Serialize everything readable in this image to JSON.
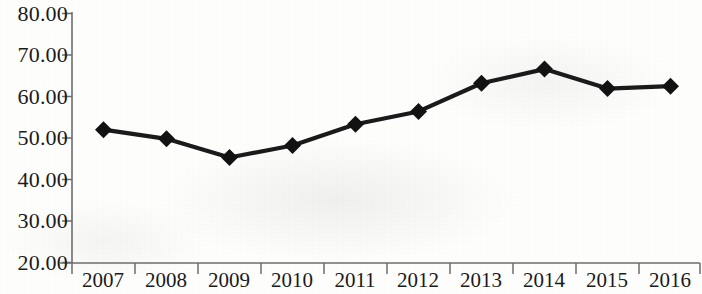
{
  "chart_data": {
    "type": "line",
    "title": "",
    "subtitle": "",
    "xlabel": "",
    "ylabel": "",
    "categories": [
      "2007",
      "2008",
      "2009",
      "2010",
      "2011",
      "2012",
      "2013",
      "2014",
      "2015",
      "2016"
    ],
    "values": [
      52.0,
      49.8,
      45.3,
      48.2,
      53.3,
      56.4,
      63.2,
      66.6,
      61.9,
      62.5
    ],
    "series": [
      {
        "name": "",
        "values": [
          52.0,
          49.8,
          45.3,
          48.2,
          53.3,
          56.4,
          63.2,
          66.6,
          61.9,
          62.5
        ]
      }
    ],
    "ylim": [
      20.0,
      80.0
    ],
    "y_ticks": [
      20.0,
      30.0,
      40.0,
      50.0,
      60.0,
      70.0,
      80.0
    ],
    "y_tick_labels": [
      "20.00",
      "30.00",
      "40.00",
      "50.00",
      "60.00",
      "70.00",
      "80.00"
    ],
    "x_tick_labels": [
      "2007",
      "2008",
      "2009",
      "2010",
      "2011",
      "2012",
      "2013",
      "2014",
      "2015",
      "2016"
    ],
    "grid": false,
    "legend": false,
    "legend_position": "none",
    "marker": "diamond",
    "line_color": "#1a1a1a",
    "marker_color": "#111111",
    "axis_color": "#6d6d6d",
    "background_color": "#fefefd"
  },
  "axes": {
    "y_labels": [
      "80.00",
      "70.00",
      "60.00",
      "50.00",
      "40.00",
      "30.00",
      "20.00"
    ],
    "x_labels": [
      "2007",
      "2008",
      "2009",
      "2010",
      "2011",
      "2012",
      "2013",
      "2014",
      "2015",
      "2016"
    ]
  }
}
